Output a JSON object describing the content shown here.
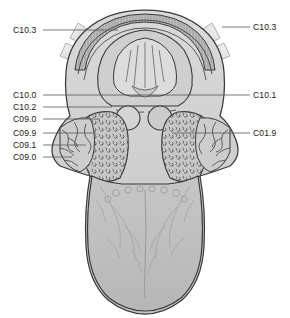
{
  "figure": {
    "colors": {
      "outline": "#3a3a3a",
      "tissue_light": "#d8d8d8",
      "tissue_mid": "#c2c2c2",
      "tissue_dark": "#a8a8a8",
      "tongue_fill": "#c0c0c0",
      "palate_band": "#b5b5b5",
      "retractor": "#cfcfcf",
      "leader_line": "#555555",
      "label_text": "#1a1a1a",
      "background": "#ffffff"
    }
  },
  "labels": {
    "left": [
      {
        "code": "C10.3",
        "x": 14,
        "y": 30,
        "leader_to_x": 118,
        "leader_y": 32
      },
      {
        "code": "C10.0",
        "x": 14,
        "y": 95,
        "leader_to_x": 148,
        "leader_y": 98
      },
      {
        "code": "C10.2",
        "x": 14,
        "y": 107,
        "leader_to_x": 112,
        "leader_y": 110
      },
      {
        "code": "C09.0",
        "x": 14,
        "y": 119,
        "leader_to_x": 100,
        "leader_y": 122
      },
      {
        "code": "C09.9",
        "x": 14,
        "y": 133,
        "leader_to_x": 96,
        "leader_y": 136
      },
      {
        "code": "C09.1",
        "x": 14,
        "y": 145,
        "leader_to_x": 86,
        "leader_y": 148
      },
      {
        "code": "C09.0",
        "x": 14,
        "y": 157,
        "leader_to_x": 72,
        "leader_y": 160
      }
    ],
    "right": [
      {
        "code": "C10.3",
        "x": 253,
        "y": 30,
        "leader_from_x": 222,
        "leader_y": 27
      },
      {
        "code": "C10.1",
        "x": 253,
        "y": 95,
        "leader_from_x": 148,
        "leader_y": 98
      },
      {
        "code": "C01.9",
        "x": 253,
        "y": 133,
        "leader_from_x": 172,
        "leader_y": 136
      }
    ]
  }
}
